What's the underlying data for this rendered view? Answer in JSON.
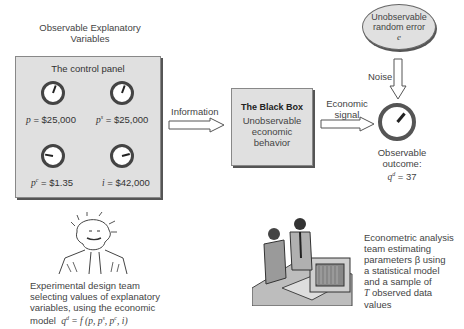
{
  "diagram": {
    "explanatory": {
      "heading_line1": "Observable Explanatory",
      "heading_line2": "Variables",
      "panel_title": "The control panel",
      "gauges": [
        {
          "var": "p",
          "sup": "",
          "value": "= $25,000",
          "needle_deg": 20
        },
        {
          "var": "p",
          "sup": "s",
          "value": "= $25,000",
          "needle_deg": 20
        },
        {
          "var": "p",
          "sup": "c",
          "value": "= $1.35",
          "needle_deg": -80
        },
        {
          "var": "i",
          "sup": "",
          "value": "= $42,000",
          "needle_deg": 75
        }
      ]
    },
    "information_label": "Information",
    "black_box": {
      "title": "The Black Box",
      "body_line1": "Unobservable",
      "body_line2": "economic",
      "body_line3": "behavior"
    },
    "signal_label_line1": "Economic",
    "signal_label_line2": "signal",
    "random_error": {
      "line1": "Unobservable",
      "line2": "random error",
      "symbol": "e"
    },
    "noise_label": "Noise",
    "outcome": {
      "label": "Observable outcome:",
      "var": "q",
      "sup": "d",
      "value": "= 37",
      "needle_deg": 40
    },
    "experimental_team": {
      "line1": "Experimental design team",
      "line2": "selecting values of explanatory",
      "line3": "variables, using the economic",
      "line4_prefix": "model",
      "model_formula": "q",
      "model_sup": "d",
      "model_rest": " = f (p, p",
      "model_sup2": "s",
      "model_mid": ", p",
      "model_sup3": "c",
      "model_end": ", i)"
    },
    "econometric_team": {
      "line1": "Econometric analysis",
      "line2": "team estimating",
      "line3": "parameters β using",
      "line4": "a statistical model",
      "line5": "and a sample of",
      "line6_var": "T",
      "line6_rest": " observed data",
      "line7": "values"
    }
  }
}
